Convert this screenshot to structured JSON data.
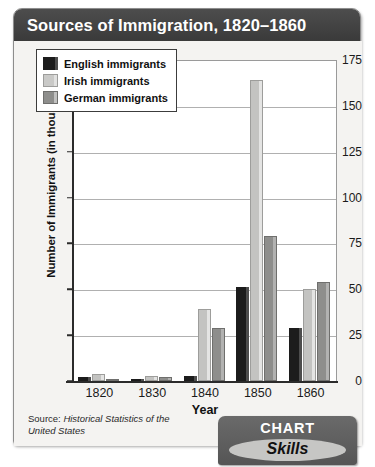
{
  "figure": {
    "title": "Sources of Immigration, 1820–1860",
    "source_label": "Source:",
    "source_title": "Historical Statistics of the United States"
  },
  "badge": {
    "top_label": "CHART",
    "bottom_label": "Skills"
  },
  "chart_data": {
    "type": "bar",
    "title": "Sources of Immigration, 1820–1860",
    "xlabel": "Year",
    "ylabel": "Number of Immigrants (in thousands)",
    "categories": [
      "1820",
      "1830",
      "1840",
      "1850",
      "1860"
    ],
    "ylim": [
      0,
      175
    ],
    "yticks": [
      0,
      25,
      50,
      75,
      100,
      125,
      150,
      175
    ],
    "ytick_labels": [
      "0",
      "25",
      "50",
      "75",
      "100",
      "125",
      "150",
      "175"
    ],
    "grid": true,
    "legend_position": "upper-left-inside",
    "series": [
      {
        "name": "English immigrants",
        "color": "#1c1c1c",
        "values": [
          2,
          1,
          3,
          51,
          29
        ]
      },
      {
        "name": "Irish immigrants",
        "color": "#c3c3c1",
        "values": [
          4,
          3,
          39,
          164,
          50
        ]
      },
      {
        "name": "German immigrants",
        "color": "#8e8e8c",
        "values": [
          1,
          2,
          29,
          79,
          54
        ]
      }
    ]
  }
}
